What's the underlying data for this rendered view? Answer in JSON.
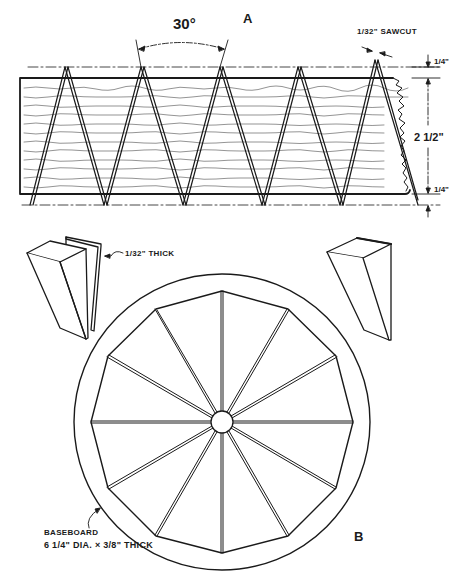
{
  "figure": {
    "panel_a": {
      "label": "A",
      "angle_label": "30°",
      "sawcut_label": "1/32\" SAWCUT",
      "dimensions": {
        "top_margin": "1/4\"",
        "board_height": "2 1/2\"",
        "bottom_margin": "1/4\""
      },
      "wedge_count_visible": 5
    },
    "wedge_detail": {
      "slip_label": "1/32\" THICK"
    },
    "panel_b": {
      "label": "B",
      "segments": 12,
      "baseboard_label_line1": "BASEBOARD",
      "baseboard_label_line2": "6 1/4\" DIA. × 3/8\" THICK"
    }
  },
  "colors": {
    "ink": "#1a1a1a",
    "paper": "#ffffff",
    "grain": "#555555"
  }
}
